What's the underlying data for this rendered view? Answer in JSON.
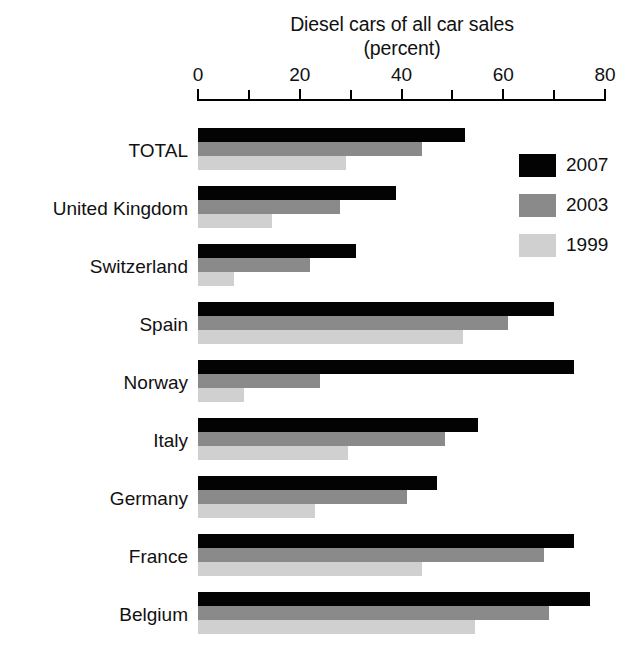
{
  "chart_data": {
    "type": "bar",
    "orientation": "horizontal",
    "title": "Diesel cars of all car sales",
    "subtitle": "(percent)",
    "xlabel": "",
    "ylabel": "",
    "xlim": [
      0,
      80
    ],
    "grid": false,
    "legend_position": "top-right",
    "tick_labels": [
      "0",
      "20",
      "40",
      "60",
      "80"
    ],
    "tick_values": [
      0,
      20,
      40,
      60,
      80
    ],
    "minor_tick_values": [
      10,
      30,
      50,
      70
    ],
    "categories": [
      "TOTAL",
      "United Kingdom",
      "Switzerland",
      "Spain",
      "Norway",
      "Italy",
      "Germany",
      "France",
      "Belgium"
    ],
    "series": [
      {
        "name": "2007",
        "color": "#030303",
        "values": [
          52.5,
          39,
          31,
          70,
          74,
          55,
          47,
          74,
          77
        ]
      },
      {
        "name": "2003",
        "color": "#8a8a8a",
        "values": [
          44,
          28,
          22,
          61,
          24,
          48.5,
          41,
          68,
          69
        ]
      },
      {
        "name": "1999",
        "color": "#d0d0d0",
        "values": [
          29,
          14.5,
          7,
          52,
          9,
          29.5,
          23,
          44,
          54.5
        ]
      }
    ]
  },
  "legend": {
    "items": [
      {
        "label": "2007",
        "swatch": "sw-2007"
      },
      {
        "label": "2003",
        "swatch": "sw-2003"
      },
      {
        "label": "1999",
        "swatch": "sw-1999"
      }
    ]
  }
}
